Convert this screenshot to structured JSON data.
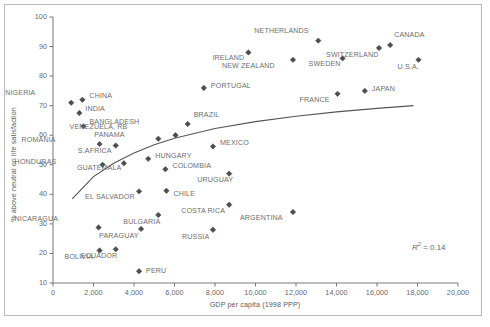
{
  "chart_data": {
    "type": "scatter",
    "title": "",
    "xlabel": "GDP per capita (1998 PPP)",
    "ylabel": "% above neutral on life satisfaction",
    "xlim": [
      0,
      20000
    ],
    "ylim": [
      10,
      100
    ],
    "xticks": [
      "0",
      "2,000",
      "4,000",
      "6,000",
      "8,000",
      "10,000",
      "12,000",
      "14,000",
      "16,000",
      "18,000",
      "20,000"
    ],
    "xtick_values": [
      0,
      2000,
      4000,
      6000,
      8000,
      10000,
      12000,
      14000,
      16000,
      18000,
      20000
    ],
    "yticks": [
      "10",
      "20",
      "30",
      "40",
      "50",
      "60",
      "70",
      "80",
      "90",
      "100"
    ],
    "ytick_values": [
      10,
      20,
      30,
      40,
      50,
      60,
      70,
      80,
      90,
      100
    ],
    "grid": false,
    "legend": null,
    "annotation": "R2 = 0.14",
    "annotation_r2_value": "0.14",
    "marker": "diamond",
    "marker_color": "#4d4d4d",
    "trendline": {
      "present": true,
      "style": "logarithmic",
      "color": "#555555",
      "points": [
        {
          "x": 950,
          "y": 38.5
        },
        {
          "x": 2000,
          "y": 46.0
        },
        {
          "x": 3000,
          "y": 50.5
        },
        {
          "x": 4000,
          "y": 54.0
        },
        {
          "x": 5000,
          "y": 56.8
        },
        {
          "x": 6000,
          "y": 59.0
        },
        {
          "x": 8000,
          "y": 62.3
        },
        {
          "x": 10000,
          "y": 64.6
        },
        {
          "x": 12000,
          "y": 66.4
        },
        {
          "x": 14000,
          "y": 67.9
        },
        {
          "x": 16000,
          "y": 69.1
        },
        {
          "x": 17800,
          "y": 70.0
        }
      ]
    },
    "points": [
      {
        "name": "NIGERIA",
        "x": 900,
        "y": 71.0,
        "lx": -44,
        "ly": -10
      },
      {
        "name": "CHINA",
        "x": 1450,
        "y": 72.0,
        "lx": 7,
        "ly": -4
      },
      {
        "name": "INDIA",
        "x": 1300,
        "y": 67.5,
        "lx": 6,
        "ly": -4
      },
      {
        "name": "BANGLADESH",
        "x": 1500,
        "y": 63.0,
        "lx": 6,
        "ly": -4
      },
      {
        "name": "ROMANIA",
        "x": 2300,
        "y": 57.0,
        "lx": -52,
        "ly": -4
      },
      {
        "name": "S.AFRICA",
        "x": 3100,
        "y": 56.5,
        "lx": -12,
        "ly": 5
      },
      {
        "name": "HONDURAS",
        "x": 2450,
        "y": 50.0,
        "lx": -54,
        "ly": -3
      },
      {
        "name": "GUATEMALA",
        "x": 3500,
        "y": 50.5,
        "lx": -10,
        "ly": 5
      },
      {
        "name": "PANAMA",
        "x": 5200,
        "y": 58.8,
        "lx": -42,
        "ly": -4
      },
      {
        "name": "VENEZUELA, RB",
        "x": 6050,
        "y": 60.0,
        "lx": -56,
        "ly": -8
      },
      {
        "name": "BRAZIL",
        "x": 6650,
        "y": 63.8,
        "lx": 6,
        "ly": -9
      },
      {
        "name": "HUNGARY",
        "x": 4700,
        "y": 52.0,
        "lx": 7,
        "ly": -3
      },
      {
        "name": "COLOMBIA",
        "x": 5550,
        "y": 48.5,
        "lx": 7,
        "ly": -3
      },
      {
        "name": "MEXICO",
        "x": 7900,
        "y": 56.2,
        "lx": 7,
        "ly": -3
      },
      {
        "name": "URUGUAY",
        "x": 8700,
        "y": 47.0,
        "lx": -4,
        "ly": 6
      },
      {
        "name": "EL SALVADOR",
        "x": 4250,
        "y": 41.0,
        "lx": -12,
        "ly": 6
      },
      {
        "name": "CHILE",
        "x": 5600,
        "y": 41.2,
        "lx": 7,
        "ly": 3
      },
      {
        "name": "COSTA RICA",
        "x": 8700,
        "y": 36.5,
        "lx": -12,
        "ly": 6
      },
      {
        "name": "NICARAGUA",
        "x": 2250,
        "y": 28.8,
        "lx": -48,
        "ly": -8
      },
      {
        "name": "BULGARIA",
        "x": 5200,
        "y": 33.0,
        "lx": -6,
        "ly": 7
      },
      {
        "name": "PARAGUAY",
        "x": 4350,
        "y": 28.3,
        "lx": -10,
        "ly": 7
      },
      {
        "name": "RUSSIA",
        "x": 7900,
        "y": 28.0,
        "lx": -12,
        "ly": 7
      },
      {
        "name": "ARGENTINA",
        "x": 11850,
        "y": 34.0,
        "lx": -18,
        "ly": 6
      },
      {
        "name": "BOLIVIA",
        "x": 2300,
        "y": 21.0,
        "lx": -14,
        "ly": 7
      },
      {
        "name": "ECUADOR",
        "x": 3100,
        "y": 21.4,
        "lx": -6,
        "ly": 7
      },
      {
        "name": "PERU",
        "x": 4250,
        "y": 14.0,
        "lx": 7,
        "ly": 0
      },
      {
        "name": "PORTUGAL",
        "x": 7450,
        "y": 76.0,
        "lx": 7,
        "ly": -2
      },
      {
        "name": "IRELAND",
        "x": 9650,
        "y": 88.0,
        "lx": -12,
        "ly": 6
      },
      {
        "name": "NEW ZEALAND",
        "x": 11850,
        "y": 85.5,
        "lx": -26,
        "ly": 6
      },
      {
        "name": "NETHERLANDS",
        "x": 13100,
        "y": 92.0,
        "lx": -18,
        "ly": -10
      },
      {
        "name": "SWEDEN",
        "x": 14300,
        "y": 86.0,
        "lx": -10,
        "ly": 6
      },
      {
        "name": "SWITZERLAND",
        "x": 16100,
        "y": 89.5,
        "lx": -8,
        "ly": 7
      },
      {
        "name": "CANADA",
        "x": 16650,
        "y": 90.5,
        "lx": 4,
        "ly": -10
      },
      {
        "name": "U.S.A.",
        "x": 18050,
        "y": 85.5,
        "lx": -8,
        "ly": 7
      },
      {
        "name": "FRANCE",
        "x": 14050,
        "y": 74.0,
        "lx": -16,
        "ly": 6
      },
      {
        "name": "JAPAN",
        "x": 15400,
        "y": 75.0,
        "lx": 7,
        "ly": -2
      }
    ]
  }
}
